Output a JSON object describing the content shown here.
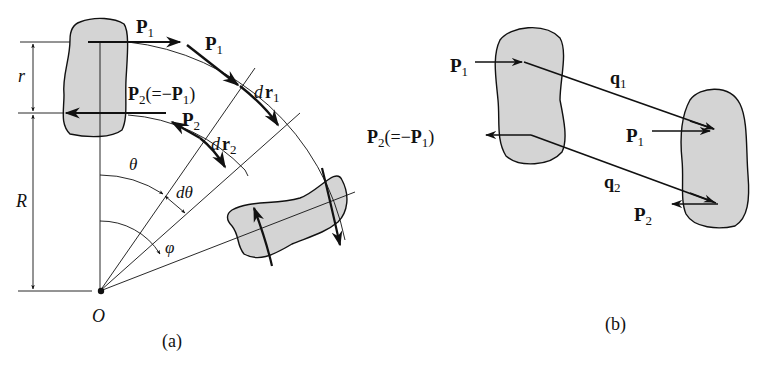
{
  "figure_a": {
    "caption": "(a)",
    "labels": {
      "P1_top": "P",
      "P1_top_sub": "1",
      "P1_tangent": "P",
      "P1_tangent_sub": "1",
      "P2_eq": "P",
      "P2_eq_sub": "2",
      "P2_eq_rest_open": "(=−",
      "P2_eq_P": "P",
      "P2_eq_P_sub": "1",
      "P2_eq_close": ")",
      "P2_tangent": "P",
      "P2_tangent_sub": "2",
      "dr1_d": "d",
      "dr1_r": "r",
      "dr1_sub": "1",
      "dr2_d": "d",
      "dr2_r": "r",
      "dr2_sub": "2",
      "r": "r",
      "R": "R",
      "theta": "θ",
      "dtheta": "dθ",
      "phi": "φ",
      "origin": "O"
    }
  },
  "figure_b": {
    "caption": "(b)",
    "labels": {
      "P1_left": "P",
      "P1_left_sub": "1",
      "P2_left": "P",
      "P2_left_sub": "2",
      "P2_left_rest_open": "(=−",
      "P2_left_P": "P",
      "P2_left_P_sub": "1",
      "P2_left_close": ")",
      "q1": "q",
      "q1_sub": "1",
      "q2": "q",
      "q2_sub": "2",
      "P1_right": "P",
      "P1_right_sub": "1",
      "P2_right": "P",
      "P2_right_sub": "2"
    }
  },
  "colors": {
    "ink": "#111111",
    "blob_fill": "#d4d4d4"
  }
}
